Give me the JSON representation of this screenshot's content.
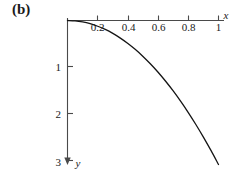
{
  "panel": {
    "label": "(b)"
  },
  "chart_data": {
    "type": "line",
    "title": "",
    "subtitle": "",
    "xlabel": "x",
    "ylabel": "y",
    "xlim": [
      0,
      1.08
    ],
    "ylim": [
      -3.15,
      0
    ],
    "grid": false,
    "legend": null,
    "x_ticks": [
      0.2,
      0.4,
      0.6,
      0.8,
      1
    ],
    "x_tick_labels": [
      "0.2",
      "0.4",
      "0.6",
      "0.8",
      "1"
    ],
    "y_ticks": [
      -1,
      -2,
      -3
    ],
    "y_tick_labels": [
      "1",
      "2",
      "3"
    ],
    "y_axis_direction": "downward-positive-labels",
    "series": [
      {
        "name": "curve",
        "x": [
          0,
          0.05,
          0.1,
          0.15,
          0.2,
          0.25,
          0.3,
          0.35,
          0.4,
          0.45,
          0.5,
          0.55,
          0.6,
          0.65,
          0.7,
          0.75,
          0.8,
          0.85,
          0.9,
          0.95,
          1.0
        ],
        "y": [
          0,
          -0.008,
          -0.031,
          -0.069,
          -0.123,
          -0.192,
          -0.277,
          -0.377,
          -0.492,
          -0.623,
          -0.77,
          -0.932,
          -1.109,
          -1.302,
          -1.51,
          -1.734,
          -1.973,
          -2.228,
          -2.498,
          -2.784,
          -3.085
        ]
      }
    ],
    "annotations": [
      {
        "text": "(b)",
        "x_px": 12,
        "y_px": 4
      }
    ],
    "axis_arrows": {
      "x": "right",
      "y": "down"
    }
  }
}
